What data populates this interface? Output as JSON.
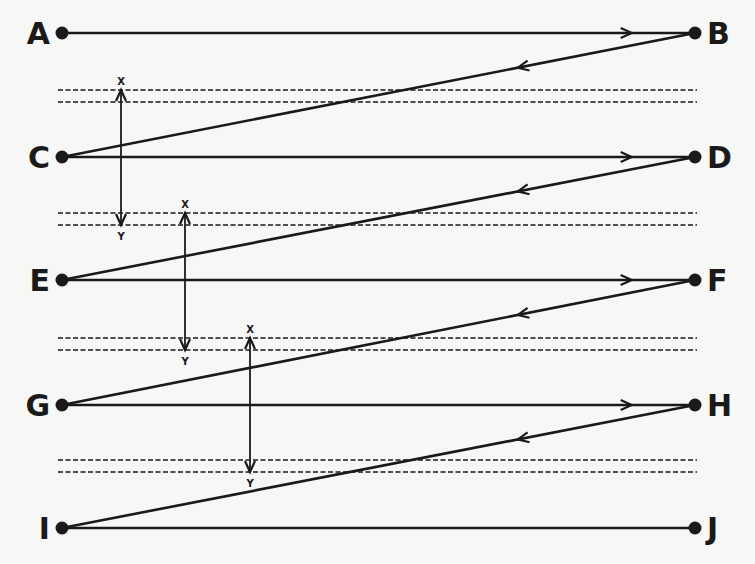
{
  "diagram": {
    "title": "",
    "colors": {
      "background": "#f7f7f5",
      "ink": "#1a1a1a"
    },
    "nodes": [
      {
        "id": "A",
        "label": "A",
        "x": 62,
        "y": 33,
        "side": "left"
      },
      {
        "id": "B",
        "label": "B",
        "x": 695,
        "y": 33,
        "side": "right"
      },
      {
        "id": "C",
        "label": "C",
        "x": 62,
        "y": 157,
        "side": "left"
      },
      {
        "id": "D",
        "label": "D",
        "x": 695,
        "y": 157,
        "side": "right"
      },
      {
        "id": "E",
        "label": "E",
        "x": 62,
        "y": 280,
        "side": "left"
      },
      {
        "id": "F",
        "label": "F",
        "x": 695,
        "y": 280,
        "side": "right"
      },
      {
        "id": "G",
        "label": "G",
        "x": 62,
        "y": 405,
        "side": "left"
      },
      {
        "id": "H",
        "label": "H",
        "x": 695,
        "y": 405,
        "side": "right"
      },
      {
        "id": "I",
        "label": "I",
        "x": 62,
        "y": 528,
        "side": "left"
      },
      {
        "id": "J",
        "label": "J",
        "x": 695,
        "y": 528,
        "side": "right"
      }
    ],
    "edges": [
      {
        "from": "A",
        "to": "B",
        "type": "forward",
        "arrow_at": 0.9
      },
      {
        "from": "B",
        "to": "C",
        "type": "return",
        "arrow_at": 0.28
      },
      {
        "from": "C",
        "to": "D",
        "type": "forward",
        "arrow_at": 0.9
      },
      {
        "from": "D",
        "to": "E",
        "type": "return",
        "arrow_at": 0.28
      },
      {
        "from": "E",
        "to": "F",
        "type": "forward",
        "arrow_at": 0.9
      },
      {
        "from": "F",
        "to": "G",
        "type": "return",
        "arrow_at": 0.28
      },
      {
        "from": "G",
        "to": "H",
        "type": "forward",
        "arrow_at": 0.9
      },
      {
        "from": "H",
        "to": "I",
        "type": "return",
        "arrow_at": 0.28
      },
      {
        "from": "I",
        "to": "J",
        "type": "plain"
      }
    ],
    "dashed_pairs": [
      {
        "y1": 90,
        "y2": 102
      },
      {
        "y1": 213,
        "y2": 225
      },
      {
        "y1": 338,
        "y2": 350
      },
      {
        "y1": 460,
        "y2": 472
      }
    ],
    "dashed_x_range": [
      58,
      697
    ],
    "spans": [
      {
        "x": 121,
        "y_top": 90,
        "y_bottom": 225,
        "top_label": "X",
        "bottom_label": "Y"
      },
      {
        "x": 185,
        "y_top": 213,
        "y_bottom": 350,
        "top_label": "X",
        "bottom_label": "Y"
      },
      {
        "x": 250,
        "y_top": 338,
        "y_bottom": 472,
        "top_label": "X",
        "bottom_label": "Y"
      }
    ]
  }
}
